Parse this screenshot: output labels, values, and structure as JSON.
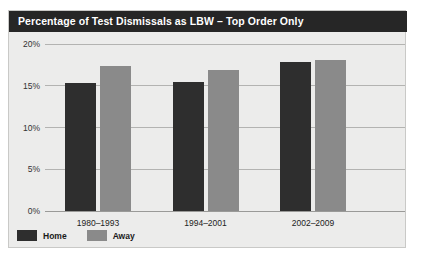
{
  "panel": {
    "title": "Percentage of Test Dismissals as LBW – Top Order Only",
    "background_color": "#ececeb",
    "title_bar_color": "#262626",
    "border_color": "#c9c9c7"
  },
  "legend": {
    "position": "bottom-left",
    "items": [
      {
        "label": "Home",
        "color": "#2e2e2e"
      },
      {
        "label": "Away",
        "color": "#8a8a8a"
      }
    ]
  },
  "axis": {
    "y_ticks": [
      "0%",
      "5%",
      "10%",
      "15%",
      "20%"
    ],
    "y_tick_values": [
      0,
      5,
      10,
      15,
      20
    ]
  },
  "chart_data": {
    "type": "bar",
    "title": "Percentage of Test Dismissals as LBW – Top Order Only",
    "xlabel": "",
    "ylabel": "",
    "categories": [
      "1980–1993",
      "1994–2001",
      "2002–2009"
    ],
    "series": [
      {
        "name": "Home",
        "color": "#2e2e2e",
        "values": [
          15.3,
          15.5,
          17.9
        ]
      },
      {
        "name": "Away",
        "color": "#8a8a8a",
        "values": [
          17.4,
          16.9,
          18.1
        ]
      }
    ],
    "ylim": [
      0,
      20
    ],
    "ytick_labels": [
      "0%",
      "5%",
      "10%",
      "15%",
      "20%"
    ],
    "ytick_values": [
      0,
      5,
      10,
      15,
      20
    ],
    "grid": true,
    "legend_position": "bottom-left"
  }
}
